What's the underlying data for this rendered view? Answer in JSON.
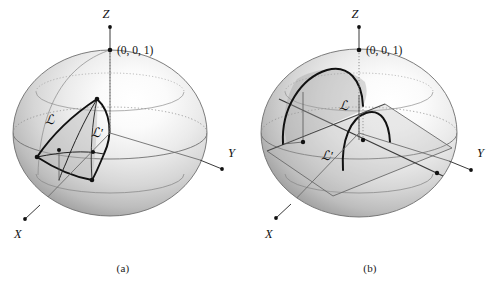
{
  "figure": {
    "background_color": "#ffffff",
    "ink_color": "#111111",
    "sphere_light_color": "#ffffff",
    "sphere_mid_color": "#cfcfcf",
    "sphere_dark_color": "#8e8e8e",
    "sphere_edge_color": "#6f6f6f",
    "curve_color": "#111111",
    "axis_color": "#444444",
    "grid_color": "#777777"
  },
  "panels": [
    {
      "id": "a",
      "caption": "(a)",
      "axis_labels": {
        "x": "X",
        "y": "Y",
        "z": "Z"
      },
      "point_label": "(0, 0, 1)",
      "curve_labels": {
        "primary": "ℒ",
        "secondary": "ℒ′"
      },
      "description": "Unit sphere with Z axis vertical, Y axis to the right, X axis to the lower left; a lune-shaped region bounded by curves L and L-prime on the left-front octant."
    },
    {
      "id": "b",
      "caption": "(b)",
      "axis_labels": {
        "x": "X",
        "y": "Y",
        "z": "Z"
      },
      "point_label": "(0, 0, 1)",
      "curve_labels": {
        "primary": "ℒ",
        "secondary": "ℒ′"
      },
      "description": "Unit sphere with a tilted great-circle plane cutting through the centre; arcs L and L-prime rise from the tilted plane."
    }
  ]
}
